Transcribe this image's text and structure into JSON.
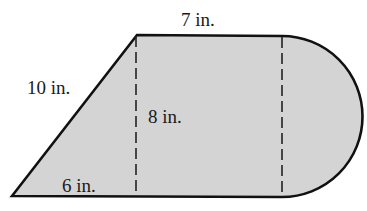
{
  "diagram": {
    "colors": {
      "fill": "#d4d4d4",
      "stroke": "#111111",
      "text": "#1a1a1a",
      "background": "#ffffff"
    },
    "labels": {
      "top": "7 in.",
      "slant": "10 in.",
      "height": "8 in.",
      "base": "6 in."
    },
    "parts": [
      {
        "name": "triangle",
        "base": "6 in.",
        "height": "8 in.",
        "hypotenuse": "10 in."
      },
      {
        "name": "rectangle",
        "width": "7 in.",
        "height": "8 in."
      },
      {
        "name": "semicircle",
        "diameter": "8 in."
      }
    ]
  }
}
